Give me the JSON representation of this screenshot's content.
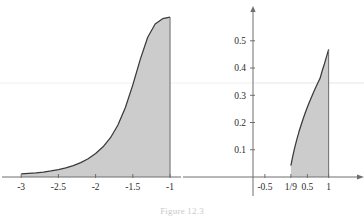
{
  "caption": {
    "label": "Figure",
    "number": "12.3",
    "text": "Figure 12.3"
  },
  "colors": {
    "curve": "#3a3a3a",
    "fill": "#c9c9c9",
    "axis": "#6e6e6e",
    "gridline": "#ededed",
    "text": "#2b2b2b",
    "background": "#ffffff"
  },
  "chart_data": [
    {
      "type": "area",
      "title": "",
      "xlabel": "",
      "ylabel": "",
      "xlim": [
        -3.15,
        -0.92
      ],
      "ylim": [
        0,
        0.56
      ],
      "xticks": [
        -3,
        -2.5,
        -2,
        -1.5,
        -1
      ],
      "xtick_labels": [
        "-3",
        "-2.5",
        "-2",
        "-1.5",
        "-1"
      ],
      "yticks": [],
      "ytick_labels": [],
      "grid": false,
      "shaded": true,
      "shade_from": -3,
      "shade_to": -1,
      "x": [
        -3.0,
        -2.9,
        -2.8,
        -2.7,
        -2.6,
        -2.5,
        -2.4,
        -2.3,
        -2.2,
        -2.1,
        -2.0,
        -1.9,
        -1.8,
        -1.7,
        -1.6,
        -1.5,
        -1.4,
        -1.3,
        -1.2,
        -1.1,
        -1.05,
        -1.0
      ],
      "y": [
        0.011,
        0.013,
        0.015,
        0.018,
        0.022,
        0.027,
        0.033,
        0.041,
        0.052,
        0.066,
        0.085,
        0.109,
        0.142,
        0.188,
        0.251,
        0.333,
        0.425,
        0.505,
        0.553,
        0.572,
        0.575,
        0.578
      ]
    },
    {
      "type": "area",
      "title": "",
      "xlabel": "",
      "ylabel": "",
      "xlim": [
        -0.78,
        1.22
      ],
      "ylim": [
        0,
        0.58
      ],
      "xticks": [
        -0.5,
        0.1111,
        0.5,
        1
      ],
      "xtick_labels": [
        "-0.5",
        "1/9",
        "0.5",
        "1"
      ],
      "yticks": [
        0.1,
        0.2,
        0.3,
        0.4,
        0.5
      ],
      "ytick_labels": [
        "0.1",
        "0.2",
        "0.3",
        "0.4",
        "0.5"
      ],
      "grid": false,
      "shaded": true,
      "shade_from": 0.1111,
      "shade_to": 1,
      "x": [
        0.1111,
        0.15,
        0.2,
        0.25,
        0.3,
        0.35,
        0.4,
        0.45,
        0.5,
        0.55,
        0.6,
        0.65,
        0.7,
        0.75,
        0.8,
        0.85,
        0.9,
        0.95,
        1.0
      ],
      "y": [
        0.042,
        0.072,
        0.107,
        0.137,
        0.165,
        0.19,
        0.214,
        0.236,
        0.257,
        0.276,
        0.295,
        0.313,
        0.33,
        0.347,
        0.363,
        0.391,
        0.415,
        0.442,
        0.468
      ]
    }
  ]
}
